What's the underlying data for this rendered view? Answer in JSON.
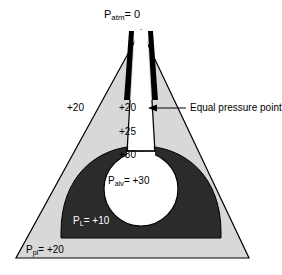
{
  "figure": {
    "title_label": "P",
    "diagram_name": "equal-pressure-point-lung-diagram"
  },
  "labels": {
    "p_atm": {
      "symbol": "P",
      "subscript": "atm",
      "value": "= 0",
      "full": "P atm = 0"
    },
    "pleural_left_pressure": "+20",
    "airway_pressure_epp": "+20",
    "airway_pressure_mid": "+25",
    "airway_pressure_lower": "+30",
    "p_alv": {
      "symbol": "P",
      "subscript": "alv",
      "value": "= +30",
      "full": "P alv = +30"
    },
    "p_l": {
      "symbol": "P",
      "subscript": "L",
      "value": "= +10",
      "full": "P L = +10"
    },
    "p_pl": {
      "symbol": "P",
      "subscript": "pl",
      "value": "= +20",
      "full": "P pl = +20"
    },
    "equal_pressure_point": "Equal pressure point"
  },
  "colors": {
    "background": "#ffffff",
    "pleural_fill": "#d8d8d8",
    "lung_fill": "#2b2b2b",
    "airway_black": "#000000",
    "alveolus_fill": "#ffffff",
    "outline": "#000000",
    "text_dark": "#000000",
    "text_light": "#ffffff"
  },
  "annotations": {
    "arrow_name": "equal-pressure-point-arrow",
    "arrow_direction": "left"
  }
}
